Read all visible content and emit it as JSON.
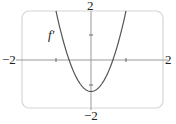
{
  "chart_data": {
    "type": "line",
    "title": "",
    "xlabel": "",
    "ylabel": "",
    "xlim": [
      -2,
      2
    ],
    "ylim": [
      -2,
      2
    ],
    "x_tick_labels": [
      "-2",
      "2"
    ],
    "y_tick_labels": [
      "-2",
      "2"
    ],
    "grid": false,
    "legend": null,
    "annotations": [
      {
        "text": "f′",
        "x": -1.3,
        "y": 1.0
      }
    ],
    "series": [
      {
        "name": "f′",
        "formula": "approx 2.3x^2 - 0.9",
        "x": [
          -1.0,
          -0.8,
          -0.6,
          -0.4,
          -0.2,
          0.0,
          0.2,
          0.4,
          0.6,
          0.8,
          1.0
        ],
        "y": [
          1.4,
          0.57,
          -0.07,
          -0.53,
          -0.81,
          -0.9,
          -0.81,
          -0.53,
          -0.07,
          0.57,
          1.4
        ]
      }
    ]
  },
  "labels": {
    "x_min": "−2",
    "x_max": "2",
    "y_max": "2",
    "y_min": "−2",
    "curve": "f′"
  }
}
